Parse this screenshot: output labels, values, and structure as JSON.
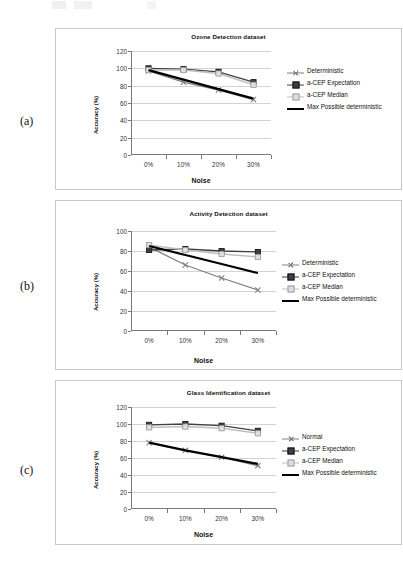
{
  "figure": {
    "panel_labels": [
      "(a)",
      "(b)",
      "(c)"
    ]
  },
  "colors": {
    "deterministic": "#7f7f7f",
    "expectation": "#404040",
    "median": "#bfbfbf",
    "max_possible": "#000000",
    "grid": "#d3d3d3",
    "axis": "#7a7a7a",
    "panel_border": "#c8c8c8"
  },
  "panels": [
    {
      "label": "(a)",
      "title": "Ozone Detection dataset",
      "xlabel": "Noise",
      "ylabel": "Accuracy (%)",
      "yticks": [
        "0",
        "20",
        "40",
        "60",
        "80",
        "100",
        "120"
      ],
      "xticks": [
        "0%",
        "10%",
        "20%",
        "30%"
      ],
      "legend": [
        "Deterministic",
        "a-CEP Expectation",
        "a-CEP Median",
        "Max Possible deterministic"
      ]
    },
    {
      "label": "(b)",
      "title": "Activity Detection dataset",
      "xlabel": "Noise",
      "ylabel": "Accuracy (%)",
      "yticks": [
        "0",
        "20",
        "40",
        "60",
        "80",
        "100"
      ],
      "xticks": [
        "0%",
        "10%",
        "20%",
        "30%"
      ],
      "legend": [
        "Deterministic",
        "a-CEP Expectation",
        "a-CEP Median",
        "Max Possible deterministic"
      ]
    },
    {
      "label": "(c)",
      "title": "Glass Identification dataset",
      "xlabel": "Noise",
      "ylabel": "Accuracy (%)",
      "yticks": [
        "0",
        "20",
        "40",
        "60",
        "80",
        "100",
        "120"
      ],
      "xticks": [
        "0%",
        "10%",
        "20%",
        "30%"
      ],
      "legend": [
        "Normal",
        "a-CEP Expectation",
        "a-CEP Median",
        "Max Possible deterministic"
      ]
    }
  ],
  "chart_data": [
    {
      "type": "line",
      "title": "Ozone Detection dataset",
      "xlabel": "Noise",
      "ylabel": "Accuracy (%)",
      "categories": [
        "0%",
        "10%",
        "20%",
        "30%"
      ],
      "ylim": [
        0,
        120
      ],
      "ytick_step": 20,
      "grid": true,
      "legend_position": "right",
      "series": [
        {
          "name": "Deterministic",
          "values": [
            97,
            84,
            75,
            64
          ]
        },
        {
          "name": "a-CEP Expectation",
          "values": [
            100,
            99,
            96,
            84
          ]
        },
        {
          "name": "a-CEP Median",
          "values": [
            98,
            98,
            94,
            81
          ]
        },
        {
          "name": "Max Possible deterministic",
          "values": [
            98,
            87,
            76,
            65
          ]
        }
      ]
    },
    {
      "type": "line",
      "title": "Activity Detection dataset",
      "xlabel": "Noise",
      "ylabel": "Accuracy (%)",
      "categories": [
        "0%",
        "10%",
        "20%",
        "30%"
      ],
      "ylim": [
        0,
        100
      ],
      "ytick_step": 20,
      "grid": true,
      "legend_position": "right",
      "series": [
        {
          "name": "Deterministic",
          "values": [
            84,
            66,
            53,
            41
          ]
        },
        {
          "name": "a-CEP Expectation",
          "values": [
            81,
            82,
            80,
            79
          ]
        },
        {
          "name": "a-CEP Median",
          "values": [
            86,
            81,
            77,
            74
          ]
        },
        {
          "name": "Max Possible deterministic",
          "values": [
            85,
            76,
            67,
            58
          ]
        }
      ]
    },
    {
      "type": "line",
      "title": "Glass Identification dataset",
      "xlabel": "Noise",
      "ylabel": "Accuracy (%)",
      "categories": [
        "0%",
        "10%",
        "20%",
        "30%"
      ],
      "ylim": [
        0,
        120
      ],
      "ytick_step": 20,
      "grid": true,
      "legend_position": "right",
      "series": [
        {
          "name": "Normal",
          "values": [
            78,
            69,
            61,
            51
          ]
        },
        {
          "name": "a-CEP Expectation",
          "values": [
            99,
            100,
            98,
            92
          ]
        },
        {
          "name": "a-CEP Median",
          "values": [
            96,
            97,
            95,
            89
          ]
        },
        {
          "name": "Max Possible deterministic",
          "values": [
            78,
            69,
            61,
            53
          ]
        }
      ]
    }
  ]
}
